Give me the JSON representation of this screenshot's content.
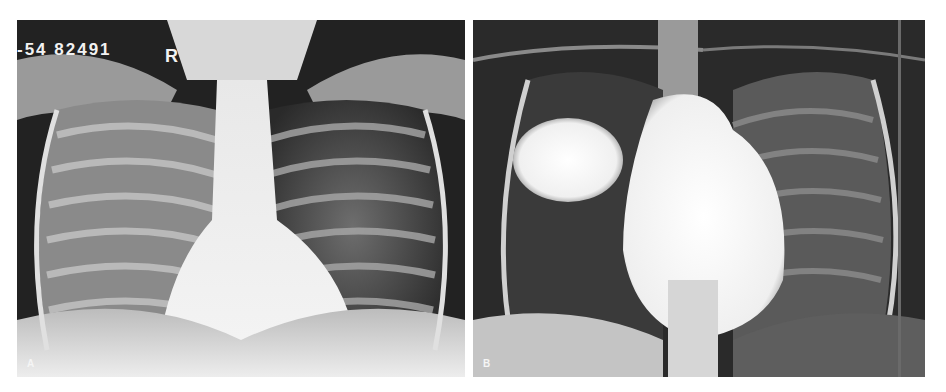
{
  "figure": {
    "panels": [
      {
        "label": "A",
        "description": "Frontal chest radiograph of a child",
        "film_id": "-54  82491",
        "side_marker": "R"
      },
      {
        "label": "B",
        "description": "Frontal chest radiograph showing rounded opacity in right upper/mid lung and enlarged cardiomediastinal silhouette"
      }
    ]
  }
}
